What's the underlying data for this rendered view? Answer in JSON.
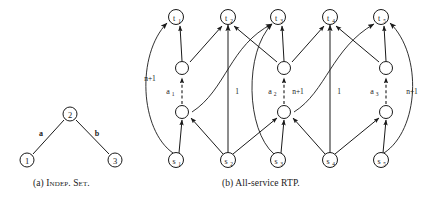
{
  "figure": {
    "panels": [
      {
        "id": "a",
        "caption": "(a) Indep. Set.",
        "caption_prefix": "(a)",
        "caption_body": "Indep. Set.",
        "type": "undirected-graph",
        "nodes": [
          {
            "name": "node-1",
            "label": "1",
            "x": 27,
            "y": 160
          },
          {
            "name": "node-2",
            "label": "2",
            "x": 70,
            "y": 114
          },
          {
            "name": "node-3",
            "label": "3",
            "x": 115,
            "y": 160
          }
        ],
        "edges": [
          {
            "name": "edge-a",
            "from": "2",
            "to": "1",
            "label": "a",
            "lx": 41,
            "ly": 133
          },
          {
            "name": "edge-b",
            "from": "2",
            "to": "3",
            "label": "b",
            "lx": 96,
            "ly": 133
          }
        ]
      },
      {
        "id": "b",
        "caption": "(b) All-service RTP.",
        "caption_prefix": "(b)",
        "caption_body": "All-service RTP.",
        "type": "directed-network",
        "sink_nodes": [
          {
            "name": "node-t1",
            "label": "t",
            "sub": "1",
            "x": 176,
            "y": 17
          },
          {
            "name": "node-t2",
            "label": "t",
            "sub": "2",
            "x": 228,
            "y": 17
          },
          {
            "name": "node-t3",
            "label": "t",
            "sub": "3",
            "x": 278,
            "y": 17
          },
          {
            "name": "node-t4",
            "label": "t",
            "sub": "4",
            "x": 330,
            "y": 17
          },
          {
            "name": "node-t5",
            "label": "t",
            "sub": "5",
            "x": 381,
            "y": 17
          }
        ],
        "source_nodes": [
          {
            "name": "node-s1",
            "label": "s",
            "sub": "1",
            "x": 176,
            "y": 160
          },
          {
            "name": "node-s2",
            "label": "s",
            "sub": "2",
            "x": 228,
            "y": 160
          },
          {
            "name": "node-s3",
            "label": "s",
            "sub": "3",
            "x": 278,
            "y": 160
          },
          {
            "name": "node-s4",
            "label": "s",
            "sub": "4",
            "x": 330,
            "y": 160
          },
          {
            "name": "node-s5",
            "label": "s",
            "sub": "5",
            "x": 381,
            "y": 160
          }
        ],
        "upper_relay_nodes": [
          {
            "name": "relay-upper-1",
            "x": 182,
            "y": 68
          },
          {
            "name": "relay-upper-2",
            "x": 284,
            "y": 68
          },
          {
            "name": "relay-upper-3",
            "x": 386,
            "y": 68
          }
        ],
        "lower_relay_nodes": [
          {
            "name": "relay-lower-1",
            "x": 182,
            "y": 112
          },
          {
            "name": "relay-lower-2",
            "x": 284,
            "y": 112
          },
          {
            "name": "relay-lower-3",
            "x": 386,
            "y": 112
          }
        ],
        "agent_labels": [
          {
            "name": "agent-label-a1",
            "label": "a",
            "sub": "1",
            "x": 168,
            "y": 91
          },
          {
            "name": "agent-label-a2",
            "label": "a",
            "sub": "2",
            "x": 270,
            "y": 91
          },
          {
            "name": "agent-label-a3",
            "label": "a",
            "sub": "3",
            "x": 372,
            "y": 91
          }
        ],
        "edge_labels": [
          {
            "name": "edge-weight-np1-left",
            "text": "n+1",
            "x": 150,
            "y": 78
          },
          {
            "name": "edge-weight-one-1",
            "text": "1",
            "x": 237,
            "y": 91
          },
          {
            "name": "edge-weight-np1-mid1",
            "text": "n+1",
            "x": 296,
            "y": 91
          },
          {
            "name": "edge-weight-one-2",
            "text": "1",
            "x": 338,
            "y": 91
          },
          {
            "name": "edge-weight-np1-right",
            "text": "n+1",
            "x": 411,
            "y": 91
          }
        ]
      }
    ]
  },
  "colors": {
    "stroke": "#1a1a1a",
    "background": "#ffffff",
    "node_fill": "#ffffff"
  }
}
